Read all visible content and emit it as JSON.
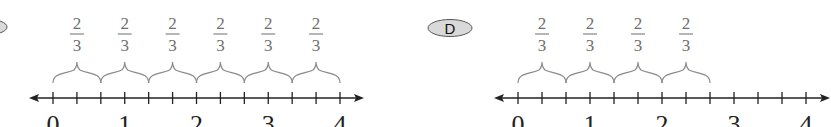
{
  "panels": [
    {
      "badge": "",
      "num": "2",
      "den": "3",
      "jumps": 6,
      "axis_labels": [
        "0",
        "1",
        "2",
        "3",
        "4"
      ],
      "x0": 53,
      "x4": 340
    },
    {
      "badge": "D",
      "num": "2",
      "den": "3",
      "jumps": 4,
      "axis_labels": [
        "0",
        "1",
        "2",
        "3",
        "4"
      ],
      "x0": 518,
      "x4": 806
    }
  ],
  "colors": {
    "brace": "#8a8a8a",
    "axis": "#222222",
    "badge_fill": "#d9d9d9"
  }
}
